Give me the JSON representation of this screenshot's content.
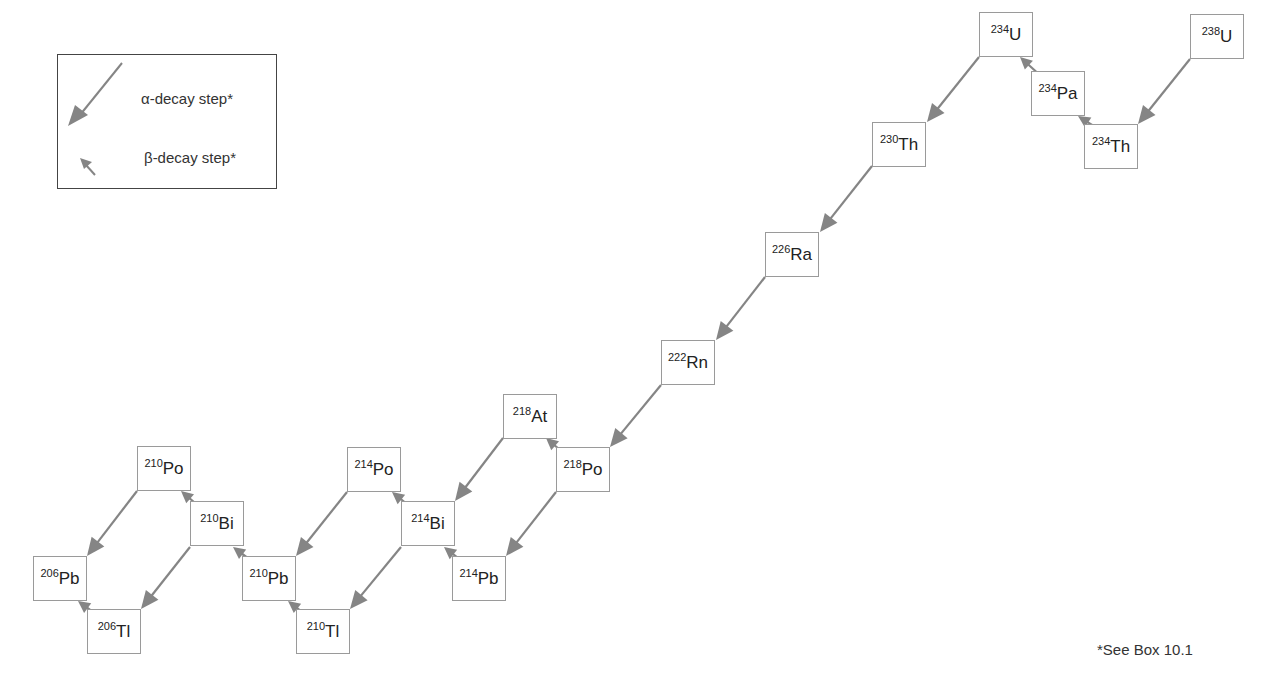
{
  "colors": {
    "arrow": "#858585",
    "box_border": "#9a9a9a",
    "legend_border": "#444444"
  },
  "legend": {
    "alpha_label": "α-decay step*",
    "beta_label": "β-decay step*"
  },
  "footnote": "*See Box 10.1",
  "nuclides": [
    {
      "id": "U238",
      "mass": "238",
      "symbol": "U",
      "x": 1190,
      "y": 14
    },
    {
      "id": "Th234",
      "mass": "234",
      "symbol": "Th",
      "x": 1084,
      "y": 124
    },
    {
      "id": "Pa234",
      "mass": "234",
      "symbol": "Pa",
      "x": 1031,
      "y": 71
    },
    {
      "id": "U234",
      "mass": "234",
      "symbol": "U",
      "x": 979,
      "y": 12
    },
    {
      "id": "Th230",
      "mass": "230",
      "symbol": "Th",
      "x": 872,
      "y": 122
    },
    {
      "id": "Ra226",
      "mass": "226",
      "symbol": "Ra",
      "x": 765,
      "y": 232
    },
    {
      "id": "Rn222",
      "mass": "222",
      "symbol": "Rn",
      "x": 661,
      "y": 340
    },
    {
      "id": "Po218",
      "mass": "218",
      "symbol": "Po",
      "x": 556,
      "y": 447
    },
    {
      "id": "At218",
      "mass": "218",
      "symbol": "At",
      "x": 503,
      "y": 394
    },
    {
      "id": "Pb214",
      "mass": "214",
      "symbol": "Pb",
      "x": 452,
      "y": 556
    },
    {
      "id": "Bi214",
      "mass": "214",
      "symbol": "Bi",
      "x": 401,
      "y": 501
    },
    {
      "id": "Po214",
      "mass": "214",
      "symbol": "Po",
      "x": 347,
      "y": 447
    },
    {
      "id": "Tl210",
      "mass": "210",
      "symbol": "Tl",
      "x": 296,
      "y": 609
    },
    {
      "id": "Pb210",
      "mass": "210",
      "symbol": "Pb",
      "x": 242,
      "y": 556
    },
    {
      "id": "Bi210",
      "mass": "210",
      "symbol": "Bi",
      "x": 190,
      "y": 501
    },
    {
      "id": "Po210",
      "mass": "210",
      "symbol": "Po",
      "x": 137,
      "y": 446
    },
    {
      "id": "Tl206",
      "mass": "206",
      "symbol": "Tl",
      "x": 87,
      "y": 609
    },
    {
      "id": "Pb206",
      "mass": "206",
      "symbol": "Pb",
      "x": 33,
      "y": 556
    }
  ],
  "decays": [
    {
      "type": "alpha",
      "from": "U238",
      "to": "Th234",
      "x1": 1190,
      "y1": 59,
      "x2": 1138,
      "y2": 124
    },
    {
      "type": "beta",
      "from": "Th234",
      "to": "Pa234",
      "x1": 1100,
      "y1": 130,
      "x2": 1078,
      "y2": 116
    },
    {
      "type": "beta",
      "from": "Pa234",
      "to": "U234",
      "x1": 1042,
      "y1": 77,
      "x2": 1020,
      "y2": 57
    },
    {
      "type": "alpha",
      "from": "U234",
      "to": "Th230",
      "x1": 979,
      "y1": 57,
      "x2": 927,
      "y2": 122
    },
    {
      "type": "alpha",
      "from": "Th230",
      "to": "Ra226",
      "x1": 872,
      "y1": 166,
      "x2": 820,
      "y2": 232
    },
    {
      "type": "alpha",
      "from": "Ra226",
      "to": "Rn222",
      "x1": 765,
      "y1": 277,
      "x2": 716,
      "y2": 340
    },
    {
      "type": "alpha",
      "from": "Rn222",
      "to": "Po218",
      "x1": 661,
      "y1": 385,
      "x2": 610,
      "y2": 447
    },
    {
      "type": "beta",
      "from": "Po218",
      "to": "At218",
      "x1": 566,
      "y1": 455,
      "x2": 546,
      "y2": 438
    },
    {
      "type": "alpha",
      "from": "At218",
      "to": "Bi214",
      "x1": 503,
      "y1": 438,
      "x2": 455,
      "y2": 501
    },
    {
      "type": "alpha",
      "from": "Po218",
      "to": "Pb214",
      "x1": 556,
      "y1": 492,
      "x2": 506,
      "y2": 556
    },
    {
      "type": "beta",
      "from": "Pb214",
      "to": "Bi214",
      "x1": 463,
      "y1": 562,
      "x2": 444,
      "y2": 547
    },
    {
      "type": "beta",
      "from": "Bi214",
      "to": "Po214",
      "x1": 412,
      "y1": 508,
      "x2": 392,
      "y2": 492
    },
    {
      "type": "alpha",
      "from": "Po214",
      "to": "Pb210",
      "x1": 347,
      "y1": 492,
      "x2": 296,
      "y2": 556
    },
    {
      "type": "alpha",
      "from": "Bi214",
      "to": "Tl210",
      "x1": 401,
      "y1": 547,
      "x2": 350,
      "y2": 609
    },
    {
      "type": "beta",
      "from": "Tl210",
      "to": "Pb210",
      "x1": 306,
      "y1": 615,
      "x2": 288,
      "y2": 601
    },
    {
      "type": "beta",
      "from": "Pb210",
      "to": "Bi210",
      "x1": 253,
      "y1": 562,
      "x2": 233,
      "y2": 547
    },
    {
      "type": "beta",
      "from": "Bi210",
      "to": "Po210",
      "x1": 201,
      "y1": 508,
      "x2": 181,
      "y2": 491
    },
    {
      "type": "alpha",
      "from": "Po210",
      "to": "Pb206",
      "x1": 137,
      "y1": 491,
      "x2": 87,
      "y2": 556
    },
    {
      "type": "alpha",
      "from": "Bi210",
      "to": "Tl206",
      "x1": 190,
      "y1": 547,
      "x2": 141,
      "y2": 609
    },
    {
      "type": "beta",
      "from": "Tl206",
      "to": "Pb206",
      "x1": 97,
      "y1": 615,
      "x2": 78,
      "y2": 601
    }
  ]
}
